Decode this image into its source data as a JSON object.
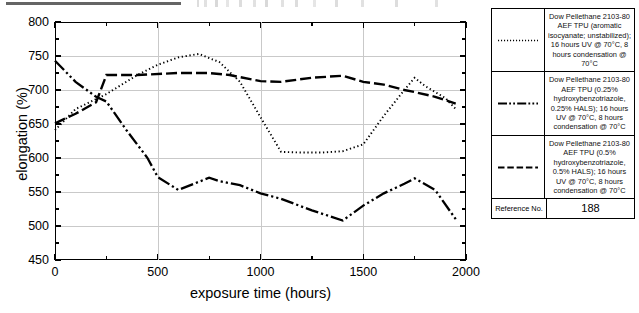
{
  "chart_data": {
    "type": "line",
    "title": "",
    "xlabel": "exposure time (hours)",
    "ylabel": "elongation (%)",
    "xlim": [
      0,
      2000
    ],
    "ylim": [
      450,
      800
    ],
    "xticks": [
      0,
      500,
      1000,
      1500,
      2000
    ],
    "yticks": [
      450,
      500,
      550,
      600,
      650,
      700,
      750,
      800
    ],
    "grid": true,
    "legend_position": "right-table",
    "series": [
      {
        "name": "Dow Pellethane 2103-80 AEF TPU (aromatic isocyanate; unstabilized); 16 hours UV @ 70°C, 8 hours condensation @ 70°C",
        "style": "dotted",
        "x": [
          0,
          100,
          250,
          400,
          500,
          600,
          700,
          800,
          900,
          1000,
          1100,
          1200,
          1300,
          1400,
          1500,
          1600,
          1700,
          1750,
          1800,
          1900,
          1950
        ],
        "y": [
          641,
          672,
          694,
          722,
          737,
          748,
          753,
          741,
          712,
          660,
          609,
          608,
          608,
          610,
          620,
          662,
          700,
          718,
          706,
          688,
          672
        ]
      },
      {
        "name": "Dow Pellethane 2103-80 AEF TPU (0.25% hydroxybenzotriazole, 0.25% HALS); 16 hours UV @ 70°C, 8 hours condensation @ 70°C",
        "style": "dash-dot-dot",
        "x": [
          0,
          100,
          200,
          250,
          350,
          450,
          500,
          600,
          700,
          750,
          800,
          900,
          1000,
          1100,
          1250,
          1400,
          1500,
          1600,
          1700,
          1750,
          1850,
          1950
        ],
        "y": [
          743,
          712,
          690,
          683,
          640,
          600,
          572,
          553,
          565,
          571,
          566,
          560,
          548,
          540,
          523,
          508,
          530,
          548,
          562,
          570,
          553,
          510
        ]
      },
      {
        "name": "Dow Pellethane 2103-80 AEF TPU (0.5% hydroxybenzotriazole, 0.5% HALS); 16 hours UV @ 70°C, 8 hours condensation @ 70°C",
        "style": "dashed",
        "x": [
          0,
          100,
          200,
          250,
          400,
          600,
          750,
          850,
          1000,
          1100,
          1250,
          1400,
          1500,
          1600,
          1700,
          1750,
          1850,
          1950
        ],
        "y": [
          651,
          665,
          682,
          722,
          722,
          725,
          725,
          722,
          713,
          712,
          718,
          721,
          712,
          708,
          700,
          697,
          690,
          680
        ]
      }
    ]
  },
  "axes": {
    "x_title": "exposure time (hours)",
    "y_title": "elongation (%)",
    "x_tick_labels": [
      "0",
      "500",
      "1000",
      "1500",
      "2000"
    ],
    "y_tick_labels": [
      "800",
      "750",
      "700",
      "650",
      "600",
      "550",
      "500",
      "450"
    ]
  },
  "legend": {
    "rows": [
      {
        "swatch": "dotted-line-swatch",
        "text": "Dow Pellethane 2103-80 AEF TPU (aromatic isocyanate; unstabilized); 16 hours UV @ 70°C, 8 hours condensation @ 70°C"
      },
      {
        "swatch": "dash-dot-dot-line-swatch",
        "text": "Dow Pellethane 2103-80 AEF TPU (0.25% hydroxybenzotriazole, 0.25% HALS); 16 hours UV @ 70°C, 8 hours condensation @ 70°C"
      },
      {
        "swatch": "dashed-line-swatch",
        "text": "Dow Pellethane 2103-80 AEF TPU (0.5% hydroxybenzotriazole, 0.5% HALS); 16 hours UV @ 70°C, 8 hours condensation @ 70°C"
      }
    ],
    "reference_label": "Reference No.",
    "reference_value": "188"
  },
  "colors": {
    "line": "#000000",
    "grid": "#c9c9c9",
    "axis": "#000000",
    "background": "#ffffff"
  }
}
